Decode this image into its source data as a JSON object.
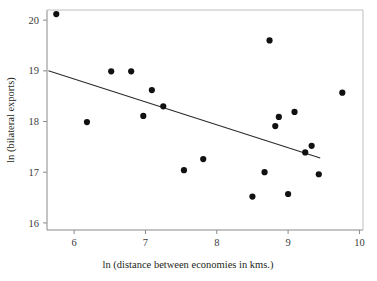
{
  "figure": {
    "background_color": "#ffffff",
    "point_color": "#111111",
    "line_color": "#2b2b2b",
    "frame_color": "#8a8a8a"
  },
  "axes": {
    "x_title": "ln (distance between economies in kms.)",
    "y_title": "ln (bilateral exports)",
    "x_ticks": [
      "6",
      "7",
      "8",
      "9",
      "10"
    ],
    "y_ticks": [
      "16",
      "17",
      "18",
      "19",
      "20"
    ]
  },
  "chart_data": {
    "type": "scatter",
    "title": "",
    "xlabel": "ln (distance between economies in kms.)",
    "ylabel": "ln (bilateral exports)",
    "xlim": [
      5.62,
      10.05
    ],
    "ylim": [
      15.86,
      20.2
    ],
    "xticks": [
      6,
      7,
      8,
      9,
      10
    ],
    "yticks": [
      16,
      17,
      18,
      19,
      20
    ],
    "grid": false,
    "legend": false,
    "points": [
      {
        "x": 5.75,
        "y": 20.12
      },
      {
        "x": 6.18,
        "y": 17.99
      },
      {
        "x": 6.52,
        "y": 18.99
      },
      {
        "x": 6.8,
        "y": 18.99
      },
      {
        "x": 6.97,
        "y": 18.11
      },
      {
        "x": 7.09,
        "y": 18.62
      },
      {
        "x": 7.25,
        "y": 18.3
      },
      {
        "x": 7.54,
        "y": 17.04
      },
      {
        "x": 7.81,
        "y": 17.26
      },
      {
        "x": 8.5,
        "y": 16.52
      },
      {
        "x": 8.67,
        "y": 17.0
      },
      {
        "x": 8.74,
        "y": 19.6
      },
      {
        "x": 8.82,
        "y": 17.91
      },
      {
        "x": 8.87,
        "y": 18.09
      },
      {
        "x": 9.0,
        "y": 16.57
      },
      {
        "x": 9.09,
        "y": 18.19
      },
      {
        "x": 9.24,
        "y": 17.39
      },
      {
        "x": 9.33,
        "y": 17.52
      },
      {
        "x": 9.43,
        "y": 16.96
      },
      {
        "x": 9.76,
        "y": 18.57
      }
    ],
    "trend_line": {
      "label": "fitted regression line",
      "x_start": 5.64,
      "y_start": 19.0,
      "x_end": 9.45,
      "y_end": 17.28
    }
  }
}
